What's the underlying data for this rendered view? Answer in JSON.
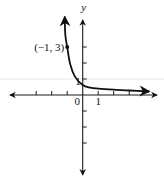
{
  "chart_data": {
    "type": "line",
    "title": "",
    "xlabel": "",
    "ylabel": "y",
    "xlim": [
      -4.7,
      4.8
    ],
    "ylim": [
      -5,
      4.7
    ],
    "x_ticks": [
      -3,
      -2,
      -1,
      1,
      2,
      3
    ],
    "y_ticks": [
      -3,
      -2,
      -1,
      1,
      2,
      3
    ],
    "tick_labels": {
      "origin": "0",
      "x_one": "1",
      "y_one": "1"
    },
    "grid": false,
    "series": [
      {
        "name": "curve",
        "points": [
          {
            "x": -1.16,
            "y": 4.9
          },
          {
            "x": -1.12,
            "y": 3.75
          },
          {
            "x": -1.0,
            "y": 3.0
          },
          {
            "x": -0.8,
            "y": 1.9
          },
          {
            "x": -0.5,
            "y": 1.15
          },
          {
            "x": 0.0,
            "y": 0.62
          },
          {
            "x": 0.5,
            "y": 0.46
          },
          {
            "x": 1.0,
            "y": 0.4
          },
          {
            "x": 2.0,
            "y": 0.33
          },
          {
            "x": 3.0,
            "y": 0.28
          },
          {
            "x": 4.3,
            "y": 0.22
          }
        ],
        "arrow_ends": true
      }
    ],
    "annotations": [
      {
        "text": "(−1, 3)",
        "x": -1,
        "y": 3,
        "marker": "dot"
      }
    ]
  }
}
